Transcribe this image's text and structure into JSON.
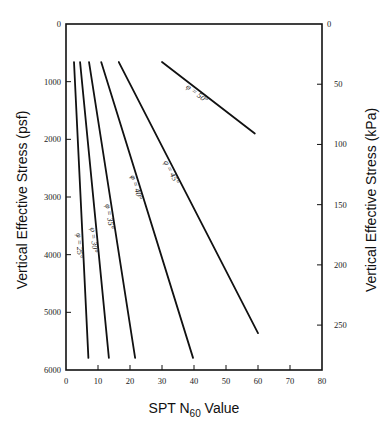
{
  "chart_data": {
    "type": "line",
    "title": "",
    "xlabel": "SPT N60 Value",
    "xlabel_main": "SPT N",
    "xlabel_sub": "60",
    "xlabel_suffix": " Value",
    "ylabel": "Vertical Effective Stress (psf)",
    "ylabel_right": "Vertical Effective Stress (kPa)",
    "xlim": [
      0,
      80
    ],
    "ylim": [
      0,
      6000
    ],
    "y_inverted": true,
    "ylim_right": [
      0,
      287
    ],
    "grid": false,
    "legend": "inline labels on curves",
    "x_ticks": [
      0,
      10,
      20,
      30,
      40,
      50,
      60,
      70,
      80
    ],
    "y_ticks": [
      0,
      1000,
      2000,
      3000,
      4000,
      5000,
      6000
    ],
    "y_ticks_right": [
      0,
      50,
      100,
      150,
      200,
      250
    ],
    "series": [
      {
        "name": "φ = 25°",
        "points": [
          [
            2.5,
            660
          ],
          [
            7,
            5790
          ]
        ]
      },
      {
        "name": "φ = 30°",
        "points": [
          [
            4.4,
            660
          ],
          [
            13.4,
            5790
          ]
        ]
      },
      {
        "name": "φ = 35°",
        "points": [
          [
            7.2,
            660
          ],
          [
            21.6,
            5790
          ]
        ]
      },
      {
        "name": "φ = 40°",
        "points": [
          [
            11,
            660
          ],
          [
            39.7,
            5790
          ]
        ]
      },
      {
        "name": "φ = 45°",
        "points": [
          [
            16.5,
            660
          ],
          [
            60,
            5360
          ]
        ]
      },
      {
        "name": "φ = 50°",
        "points": [
          [
            30,
            660
          ],
          [
            59,
            1900
          ]
        ]
      }
    ]
  },
  "layout": {
    "plot_left": 66,
    "plot_right": 322,
    "plot_top": 24,
    "plot_bottom": 370,
    "line_color": "#111111"
  }
}
